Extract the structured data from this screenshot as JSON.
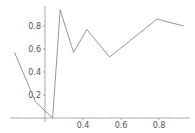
{
  "chart_data": {
    "type": "line",
    "title": "",
    "xlabel": "",
    "ylabel": "",
    "x": [
      0.04,
      0.15,
      0.24,
      0.28,
      0.35,
      0.42,
      0.54,
      0.79,
      0.93
    ],
    "series": [
      {
        "name": "series-1",
        "values": [
          0.57,
          0.14,
          0.0,
          0.94,
          0.57,
          0.77,
          0.53,
          0.86,
          0.8
        ]
      }
    ],
    "x_ticks": [
      "0.4",
      "0.6",
      "0.8"
    ],
    "y_ticks": [
      "0.2",
      "0.4",
      "0.6",
      "0.8"
    ],
    "axes_origin": {
      "x": 0.2,
      "y": 0.0
    },
    "xlim": [
      0.04,
      0.95
    ],
    "ylim": [
      0.0,
      0.96
    ],
    "grid": false,
    "legend": null,
    "colors": {
      "line": "#8a8a8a",
      "axis": "#9a9a9a",
      "tick_label": "#555555"
    }
  }
}
